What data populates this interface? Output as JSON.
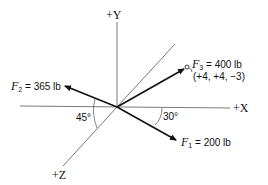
{
  "axes": {
    "y_label": "+Y",
    "x_label": "+X",
    "z_label": "+Z"
  },
  "forces": [
    {
      "name": "F",
      "sub": "1",
      "eq": " = ",
      "value": "200 lb",
      "angle_label": "30°"
    },
    {
      "name": "F",
      "sub": "2",
      "eq": " = ",
      "value": "365 lb",
      "angle_label": "45°"
    },
    {
      "name": "F",
      "sub": "3",
      "eq": " = ",
      "value": "400 lb",
      "coords": "(+4, +4, −3)"
    }
  ],
  "colors": {
    "line": "#111111",
    "axis": "#555555"
  }
}
